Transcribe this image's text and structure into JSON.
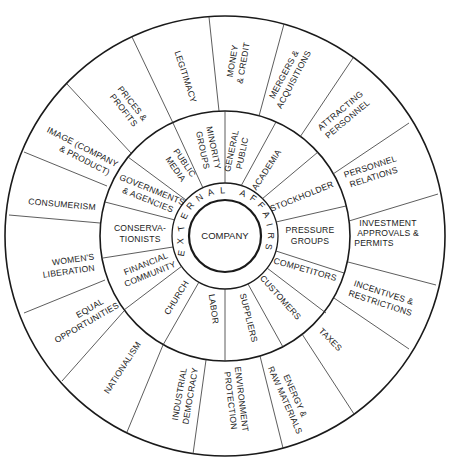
{
  "center": {
    "label": "COMPANY"
  },
  "ring_label": "EXTERNAL AFFAIRS",
  "colors": {
    "ink": "#1a1a1a",
    "background": "#ffffff"
  },
  "inner_ring": [
    {
      "id": "general-public",
      "lines": [
        "GENERAL",
        "PUBLIC"
      ]
    },
    {
      "id": "academia",
      "lines": [
        "ACADEMIA"
      ]
    },
    {
      "id": "stockholder",
      "lines": [
        "STOCKHOLDER"
      ]
    },
    {
      "id": "pressure-groups",
      "lines": [
        "PRESSURE",
        "GROUPS"
      ]
    },
    {
      "id": "competitors",
      "lines": [
        "COMPETITORS"
      ]
    },
    {
      "id": "customers",
      "lines": [
        "CUSTOMERS"
      ]
    },
    {
      "id": "suppliers",
      "lines": [
        "SUPPLIERS"
      ]
    },
    {
      "id": "labor",
      "lines": [
        "LABOR"
      ]
    },
    {
      "id": "church",
      "lines": [
        "CHURCH"
      ]
    },
    {
      "id": "financial-community",
      "lines": [
        "FINANCIAL",
        "COMMUNITY"
      ]
    },
    {
      "id": "conservationists",
      "lines": [
        "CONSERVA-",
        "TIONISTS"
      ]
    },
    {
      "id": "governments-agencies",
      "lines": [
        "GOVERNMENTS",
        "& AGENCIES"
      ]
    },
    {
      "id": "public-media",
      "lines": [
        "PUBLIC",
        "MEDIA"
      ]
    },
    {
      "id": "minority-groups",
      "lines": [
        "MINORITY",
        "GROUPS"
      ]
    }
  ],
  "outer_ring": [
    {
      "id": "money-credit",
      "lines": [
        "MONEY",
        "& CREDIT"
      ]
    },
    {
      "id": "mergers-acquisitions",
      "lines": [
        "MERGERS &",
        "ACQUISITIONS"
      ]
    },
    {
      "id": "attracting-personnel",
      "lines": [
        "ATTRACTING",
        "PERSONNEL"
      ]
    },
    {
      "id": "personnel-relations",
      "lines": [
        "PERSONNEL",
        "RELATIONS"
      ]
    },
    {
      "id": "investment-approvals",
      "lines": [
        "INVESTMENT",
        "APPROVALS &",
        "PERMITS"
      ]
    },
    {
      "id": "incentives-restrictions",
      "lines": [
        "INCENTIVES &",
        "RESTRICTIONS"
      ]
    },
    {
      "id": "taxes",
      "lines": [
        "TAXES"
      ]
    },
    {
      "id": "energy-raw-materials",
      "lines": [
        "ENERGY &",
        "RAW MATERIALS"
      ]
    },
    {
      "id": "environment-protection",
      "lines": [
        "ENVIRONMENT",
        "PROTECTION"
      ]
    },
    {
      "id": "industrial-democracy",
      "lines": [
        "INDUSTRIAL",
        "DEMOCRACY"
      ]
    },
    {
      "id": "nationalism",
      "lines": [
        "NATIONALISM"
      ]
    },
    {
      "id": "equal-opportunities",
      "lines": [
        "EQUAL",
        "OPPORTUNITIES"
      ]
    },
    {
      "id": "womens-liberation",
      "lines": [
        "WOMEN'S",
        "LIBERATION"
      ]
    },
    {
      "id": "consumerism",
      "lines": [
        "CONSUMERISM"
      ]
    },
    {
      "id": "image",
      "lines": [
        "IMAGE (COMPANY",
        "& PRODUCT)"
      ]
    },
    {
      "id": "prices-profits",
      "lines": [
        "PRICES &",
        "PROFITS"
      ]
    },
    {
      "id": "legitimacy",
      "lines": [
        "LEGITIMACY"
      ]
    }
  ]
}
